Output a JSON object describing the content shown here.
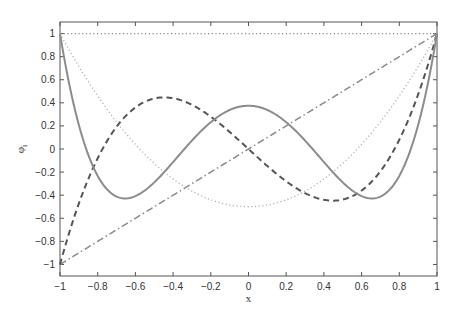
{
  "chart_data": {
    "type": "line",
    "title": "",
    "xlabel": "x",
    "ylabel": "φ",
    "ylabel_subscript": "i",
    "xlim": [
      -1,
      1
    ],
    "ylim": [
      -1.1,
      1.1
    ],
    "xticks": [
      -1,
      -0.8,
      -0.6,
      -0.4,
      -0.2,
      0,
      0.2,
      0.4,
      0.6,
      0.8,
      1
    ],
    "xtick_labels": [
      "-1",
      "-0.8",
      "-0.6",
      "-0.4",
      "-0.2",
      "0",
      "0.2",
      "0.4",
      "0.6",
      "0.8",
      "1"
    ],
    "yticks": [
      -1,
      -0.8,
      -0.6,
      -0.4,
      -0.2,
      0,
      0.2,
      0.4,
      0.6,
      0.8,
      1
    ],
    "ytick_labels": [
      "-1",
      "-0.8",
      "-0.6",
      "-0.4",
      "-0.2",
      "0",
      "0.2",
      "0.4",
      "0.6",
      "0.8",
      "1"
    ],
    "grid": false,
    "legend": null,
    "series": [
      {
        "name": "phi_0",
        "formula": "1",
        "style": "dotted",
        "color": "#8a8a8a",
        "x": [
          -1,
          -0.5,
          0,
          0.5,
          1
        ],
        "y": [
          1,
          1,
          1,
          1,
          1
        ]
      },
      {
        "name": "phi_1",
        "formula": "x",
        "style": "dash-dot",
        "color": "#8a8a8a",
        "x": [
          -1,
          -0.5,
          0,
          0.5,
          1
        ],
        "y": [
          -1,
          -0.5,
          0,
          0.5,
          1
        ]
      },
      {
        "name": "phi_2",
        "formula": "(3x^2-1)/2",
        "style": "dotted",
        "color": "#b0b0b0",
        "x": [
          -1,
          -0.8,
          -0.6,
          -0.4,
          -0.2,
          0,
          0.2,
          0.4,
          0.6,
          0.8,
          1
        ],
        "y": [
          1,
          0.46,
          0.04,
          -0.26,
          -0.44,
          -0.5,
          -0.44,
          -0.26,
          0.04,
          0.46,
          1
        ]
      },
      {
        "name": "phi_3",
        "formula": "(5x^3-3x)/2",
        "style": "dashed",
        "color": "#555555",
        "x": [
          -1,
          -0.8,
          -0.6,
          -0.447,
          -0.2,
          0,
          0.2,
          0.447,
          0.6,
          0.8,
          1
        ],
        "y": [
          -1,
          -0.08,
          0.36,
          0.447,
          0.28,
          0,
          -0.28,
          -0.447,
          -0.36,
          0.08,
          1
        ]
      },
      {
        "name": "phi_4",
        "formula": "(35x^4-30x^2+3)/8",
        "style": "solid",
        "color": "#8c8c8c",
        "x": [
          -1,
          -0.8,
          -0.655,
          -0.4,
          -0.2,
          0,
          0.2,
          0.4,
          0.655,
          0.8,
          1
        ],
        "y": [
          1,
          -0.233,
          -0.429,
          -0.113,
          0.232,
          0.375,
          0.232,
          -0.113,
          -0.429,
          -0.233,
          1
        ]
      }
    ]
  }
}
